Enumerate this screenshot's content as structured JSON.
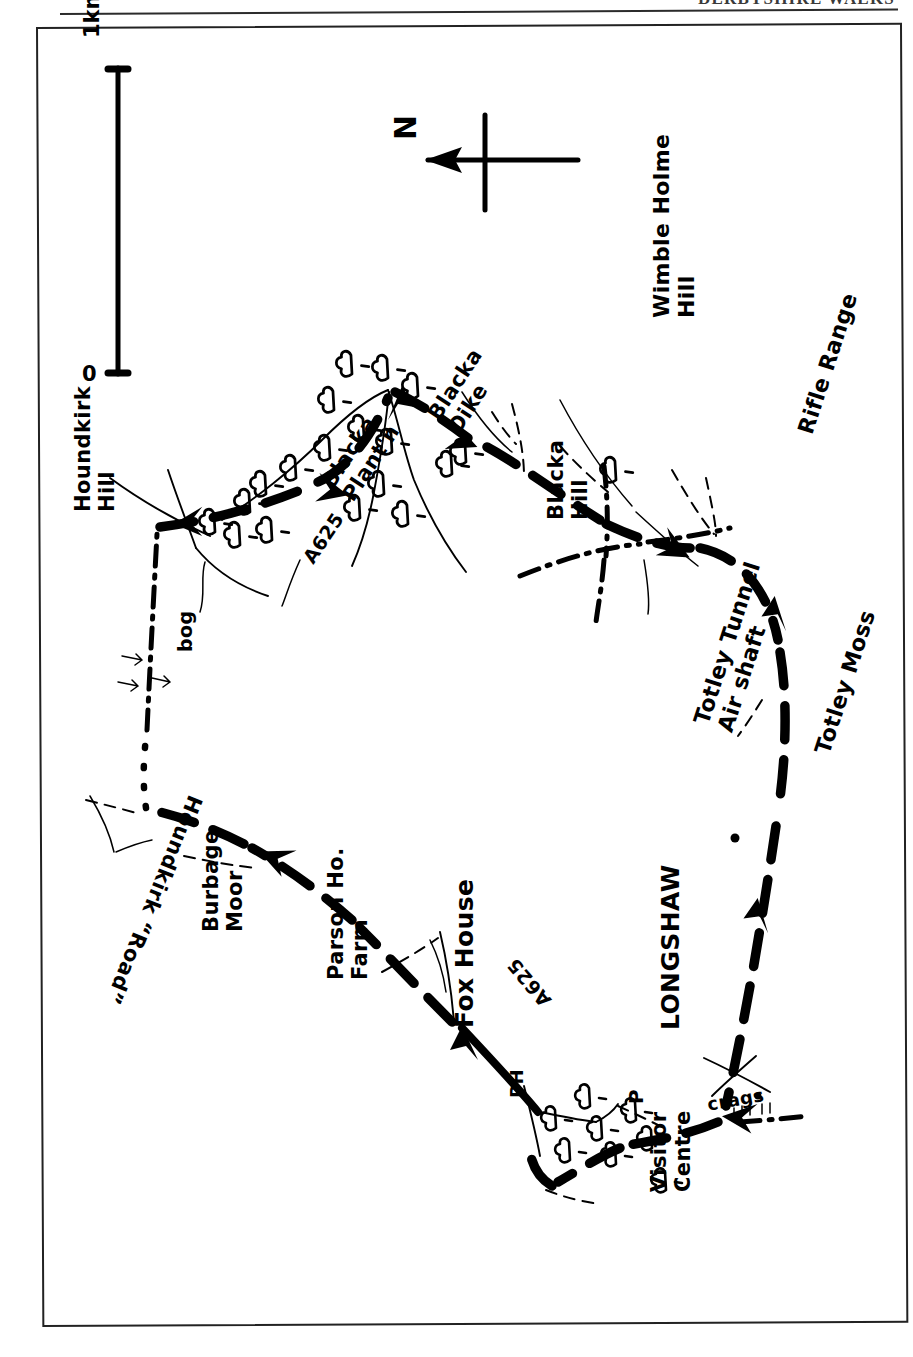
{
  "header": {
    "running_head": "DERBYSHIRE WALKS"
  },
  "map": {
    "title": "Hand-drawn walking route map",
    "orientation_note": "map drawn rotated 90 degrees; north arrow points to the left of the page",
    "ink_color": "#000000",
    "paper_color": "#ffffff",
    "frame_color": "#222222"
  },
  "scale_bar": {
    "name": "scale-bar",
    "min_label": "0",
    "max_label": "1km",
    "orientation": "vertical"
  },
  "compass": {
    "name": "north-arrow",
    "label": "N",
    "points_to": "left"
  },
  "labels": [
    {
      "id": "houndkirk-hill",
      "text": "Houndkirk\nHill",
      "line1": "Houndkirk",
      "line2": "Hill",
      "x": 72,
      "y": 512,
      "rot": -90
    },
    {
      "id": "bog",
      "text": "bog",
      "line1": "bog",
      "line2": "",
      "x": 176,
      "y": 652,
      "rot": -90
    },
    {
      "id": "blacka-plantation",
      "text": "Blacka\nPlant'n",
      "line1": "Blacka",
      "line2": "Plant'n",
      "x": 318,
      "y": 480,
      "rot": -57
    },
    {
      "id": "blacka-dike",
      "text": "Blacka\nDike",
      "line1": "Blacka",
      "line2": "Dike",
      "x": 424,
      "y": 412,
      "rot": -57
    },
    {
      "id": "a625-north",
      "text": "A625",
      "line1": "A625",
      "line2": "",
      "x": 300,
      "y": 556,
      "rot": -56
    },
    {
      "id": "blacka-hill",
      "text": "Blacka\nHill",
      "line1": "Blacka",
      "line2": "Hill",
      "x": 545,
      "y": 520,
      "rot": -90
    },
    {
      "id": "wimble-holme-hill",
      "text": "Wimble Holme\nHill",
      "line1": "Wimble Holme",
      "line2": "Hill",
      "x": 650,
      "y": 318,
      "rot": -90
    },
    {
      "id": "rifle-range",
      "text": "Rifle Range",
      "line1": "Rifle Range",
      "line2": "",
      "x": 795,
      "y": 430,
      "rot": -72
    },
    {
      "id": "totley-tunnel",
      "text": "Totley Tunnel\nAir shaft",
      "line1": "Totley Tunnel",
      "line2": "Air shaft",
      "x": 690,
      "y": 720,
      "rot": -72
    },
    {
      "id": "totley-moss",
      "text": "Totley Moss",
      "line1": "Totley Moss",
      "line2": "",
      "x": 812,
      "y": 750,
      "rot": -72
    },
    {
      "id": "houndkirk-road",
      "text": "Houndkirk “Road”",
      "line1": "Houndkirk “Road”",
      "line2": "",
      "x": 205,
      "y": 800,
      "rot": 112
    },
    {
      "id": "burbage-moor",
      "text": "Burbage\nMoor",
      "line1": "Burbage",
      "line2": "Moor",
      "x": 200,
      "y": 932,
      "rot": -90
    },
    {
      "id": "parson-house-farm",
      "text": "Parson Ho.\nFarm",
      "line1": "Parson Ho.",
      "line2": "Farm",
      "x": 325,
      "y": 980,
      "rot": -90
    },
    {
      "id": "fox-house",
      "text": "Fox House",
      "line1": "Fox House",
      "line2": "",
      "x": 452,
      "y": 1028,
      "rot": -90
    },
    {
      "id": "ph",
      "text": "PH",
      "line1": "PH",
      "line2": "",
      "x": 508,
      "y": 1098,
      "rot": -90
    },
    {
      "id": "a625-south",
      "text": "A625",
      "line1": "A625",
      "line2": "",
      "x": 540,
      "y": 1010,
      "rot": -130
    },
    {
      "id": "longshaw",
      "text": "LONGSHAW",
      "line1": "LONGSHAW",
      "line2": "",
      "x": 658,
      "y": 1030,
      "rot": -90
    },
    {
      "id": "visitor-centre",
      "text": "Visitor\nCentre",
      "line1": "Visitor",
      "line2": "Centre",
      "x": 648,
      "y": 1192,
      "rot": -90
    },
    {
      "id": "car-park",
      "text": "P",
      "line1": "P",
      "line2": "",
      "x": 626,
      "y": 1104,
      "rot": -90
    },
    {
      "id": "crags",
      "text": "crags",
      "line1": "crags",
      "line2": "",
      "x": 706,
      "y": 1096,
      "rot": -10
    }
  ],
  "route": {
    "name": "walking-route",
    "style": "thick dashed line with direction arrows",
    "shape": "closed loop",
    "direction_arrow_count": 8
  },
  "map_features": [
    "woodland / tree symbols",
    "marsh / bog symbols",
    "field boundary dashed lines",
    "streams",
    "crag tick marks",
    "dot-dash parish boundary"
  ]
}
